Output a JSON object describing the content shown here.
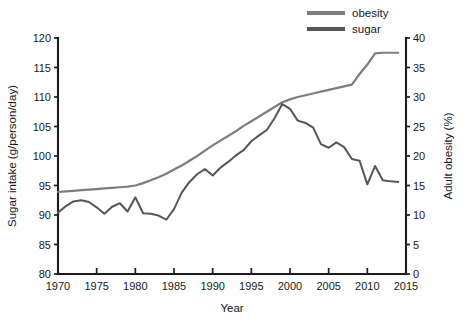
{
  "chart_data": {
    "type": "line",
    "title": "",
    "xlabel": "Year",
    "ylabel": "Sugar intake (g/person/day)",
    "y2label": "Adult obesity (%)",
    "xlim": [
      1970,
      2015
    ],
    "ylim": [
      80,
      120
    ],
    "y2lim": [
      0,
      40
    ],
    "xticks": [
      1970,
      1975,
      1980,
      1985,
      1990,
      1995,
      2000,
      2005,
      2010,
      2015
    ],
    "xticklabels": [
      "1970",
      "1975",
      "1980",
      "1985",
      "1990",
      "1995",
      "2000",
      "2005",
      "2010",
      "2015"
    ],
    "yticks": [
      80,
      85,
      90,
      95,
      100,
      105,
      110,
      115,
      120
    ],
    "yticklabels": [
      "80",
      "85",
      "90",
      "95",
      "100",
      "105",
      "110",
      "115",
      "120"
    ],
    "y2ticks": [
      0,
      5,
      10,
      15,
      20,
      25,
      30,
      35,
      40
    ],
    "y2ticklabels": [
      "0",
      "5",
      "10",
      "15",
      "20",
      "25",
      "30",
      "35",
      "40"
    ],
    "grid": false,
    "legend_position": "top-right",
    "series": [
      {
        "name": "obesity",
        "axis": "right",
        "color": "#7d7d7d",
        "unit": "%",
        "x": [
          1970,
          1971,
          1972,
          1973,
          1974,
          1975,
          1976,
          1977,
          1978,
          1979,
          1980,
          1981,
          1982,
          1983,
          1984,
          1985,
          1986,
          1987,
          1988,
          1989,
          1990,
          1991,
          1992,
          1993,
          1994,
          1995,
          1996,
          1997,
          1998,
          1999,
          2000,
          2001,
          2002,
          2003,
          2004,
          2005,
          2006,
          2007,
          2008,
          2009,
          2010,
          2011,
          2012,
          2013,
          2014
        ],
        "values": [
          13.9,
          14.0,
          14.1,
          14.2,
          14.3,
          14.4,
          14.5,
          14.6,
          14.7,
          14.8,
          15.0,
          15.4,
          15.9,
          16.4,
          17.0,
          17.7,
          18.4,
          19.2,
          20.0,
          20.9,
          21.8,
          22.6,
          23.4,
          24.2,
          25.1,
          25.9,
          26.7,
          27.5,
          28.3,
          29.1,
          29.6,
          30.0,
          30.3,
          30.6,
          30.9,
          31.2,
          31.5,
          31.8,
          32.1,
          33.9,
          35.5,
          37.4,
          37.5,
          37.5,
          37.5
        ]
      },
      {
        "name": "sugar",
        "axis": "left",
        "color": "#565656",
        "unit": "g/person/day",
        "x": [
          1970,
          1971,
          1972,
          1973,
          1974,
          1975,
          1976,
          1977,
          1978,
          1979,
          1980,
          1981,
          1982,
          1983,
          1984,
          1985,
          1986,
          1987,
          1988,
          1989,
          1990,
          1991,
          1992,
          1993,
          1994,
          1995,
          1996,
          1997,
          1998,
          1999,
          2000,
          2001,
          2002,
          2003,
          2004,
          2005,
          2006,
          2007,
          2008,
          2009,
          2010,
          2011,
          2012,
          2013,
          2014
        ],
        "values": [
          90.4,
          91.5,
          92.3,
          92.5,
          92.2,
          91.3,
          90.2,
          91.4,
          92.0,
          90.6,
          93.0,
          90.3,
          90.2,
          89.9,
          89.2,
          91.0,
          93.8,
          95.6,
          96.9,
          97.8,
          96.7,
          98.0,
          99.0,
          100.1,
          101.0,
          102.5,
          103.5,
          104.4,
          106.4,
          108.8,
          108.0,
          106.0,
          105.6,
          104.8,
          102.0,
          101.4,
          102.3,
          101.5,
          99.5,
          99.2,
          95.2,
          98.3,
          95.9,
          95.7,
          95.6
        ]
      }
    ],
    "legend": [
      {
        "label": "obesity",
        "color": "#7d7d7d"
      },
      {
        "label": "sugar",
        "color": "#565656"
      }
    ]
  },
  "plot_geometry": {
    "left": 58,
    "right": 406,
    "top": 38,
    "bottom": 274
  }
}
